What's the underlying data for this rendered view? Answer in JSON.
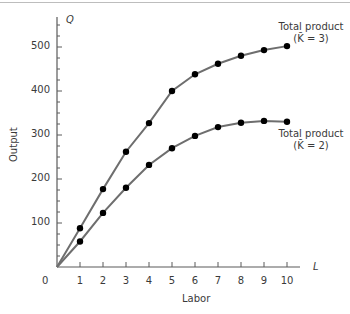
{
  "chart_data": {
    "type": "line",
    "title": "",
    "xlabel": "Labor",
    "ylabel": "Output",
    "x_axis_symbol": "L",
    "y_axis_symbol": "Q",
    "x": [
      0,
      1,
      2,
      3,
      4,
      5,
      6,
      7,
      8,
      9,
      10
    ],
    "xticks": [
      "1",
      "2",
      "3",
      "4",
      "5",
      "6",
      "7",
      "8",
      "9",
      "10"
    ],
    "yticks": [
      "100",
      "200",
      "300",
      "400",
      "500"
    ],
    "origin_label": "0",
    "xlim": [
      0,
      11.5
    ],
    "ylim": [
      0,
      560
    ],
    "grid": false,
    "series": [
      {
        "name": "Total product (K̄ = 3)",
        "label_line1": "Total product",
        "label_line2": "(K̄ = 3)",
        "values": [
          0,
          88,
          177,
          262,
          327,
          400,
          438,
          462,
          480,
          493,
          502
        ]
      },
      {
        "name": "Total product (K̄ = 2)",
        "label_line1": "Total product",
        "label_line2": "(K̄ = 2)",
        "values": [
          0,
          58,
          123,
          180,
          232,
          270,
          298,
          318,
          328,
          332,
          330
        ]
      }
    ],
    "colors": {
      "line": "#6e6e6e",
      "marker": "#000000",
      "axis": "#5a5a5a"
    }
  }
}
